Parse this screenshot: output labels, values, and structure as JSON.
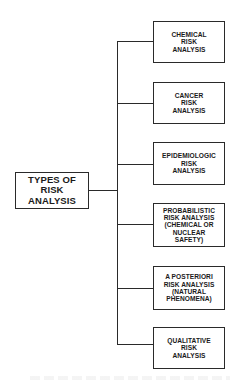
{
  "diagram": {
    "type": "tree",
    "root": {
      "label": "TYPES OF\nRISK\nANALYSIS"
    },
    "children": [
      {
        "label": "CHEMICAL\nRISK\nANALYSIS"
      },
      {
        "label": "CANCER\nRISK\nANALYSIS"
      },
      {
        "label": "EPIDEMIOLOGIC\nRISK\nANALYSIS"
      },
      {
        "label": "PROBABILISTIC\nRISK ANALYSIS\n(CHEMICAL OR\nNUCLEAR\nSAFETY)"
      },
      {
        "label": "A POSTERIORI\nRISK ANALYSIS\n(NATURAL\nPHENOMENA)"
      },
      {
        "label": "QUALITATIVE\nRISK\nANALYSIS"
      }
    ],
    "colors": {
      "line": "#2a2a2a",
      "background": "#ffffff",
      "text": "#1a1a1a"
    }
  }
}
